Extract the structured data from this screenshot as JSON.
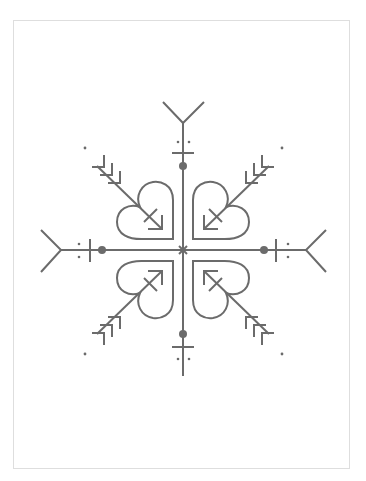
{
  "artwork": {
    "title": "Snowflake with hearts and arrows",
    "stroke_color": "#6b6b6b",
    "frame_color": "#dedede",
    "background": "#ffffff",
    "center": [
      183,
      250
    ]
  }
}
